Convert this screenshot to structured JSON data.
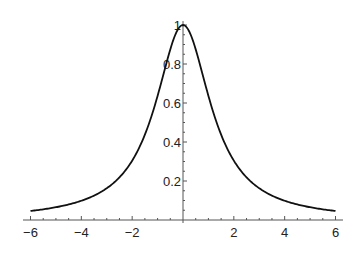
{
  "chart_data": {
    "type": "line",
    "title": "",
    "xlabel": "",
    "ylabel": "",
    "function_hint": "1/(1+x^2/1.75)",
    "xlim": [
      -6,
      6
    ],
    "ylim": [
      0,
      1
    ],
    "grid": false,
    "legend": null,
    "x_ticks": [
      "-6",
      "-4",
      "-2",
      "2",
      "4",
      "6"
    ],
    "x_tick_values": [
      -6,
      -4,
      -2,
      2,
      4,
      6
    ],
    "y_ticks": [
      "0.2",
      "0.4",
      "0.6",
      "0.8",
      "1"
    ],
    "y_tick_values": [
      0.2,
      0.4,
      0.6,
      0.8,
      1
    ],
    "series": [
      {
        "name": "curve",
        "x": [
          -6,
          -5,
          -4,
          -3,
          -2,
          -1.5,
          -1,
          -0.5,
          0,
          0.5,
          1,
          1.5,
          2,
          3,
          4,
          5,
          6
        ],
        "y": [
          0.046,
          0.065,
          0.099,
          0.163,
          0.304,
          0.437,
          0.636,
          0.875,
          1.0,
          0.875,
          0.636,
          0.437,
          0.304,
          0.163,
          0.099,
          0.065,
          0.046
        ]
      }
    ]
  },
  "colors": {
    "axis": "#555555",
    "curve": "#111111",
    "background": "#ffffff"
  }
}
